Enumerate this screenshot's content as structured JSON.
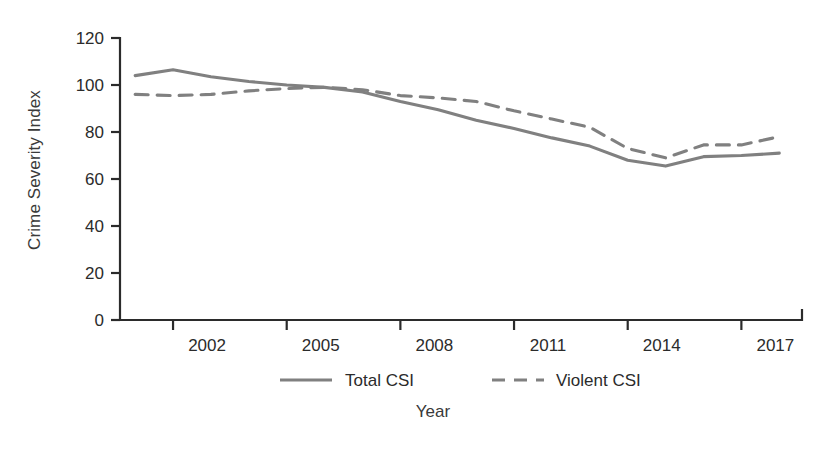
{
  "chart_data": {
    "type": "line",
    "title": "",
    "xlabel": "Year",
    "ylabel": "Crime Severity Index",
    "x": [
      2001,
      2002,
      2003,
      2004,
      2005,
      2006,
      2007,
      2008,
      2009,
      2010,
      2011,
      2012,
      2013,
      2014,
      2015,
      2016,
      2017,
      2018
    ],
    "xlim": [
      2000.6,
      2018.6
    ],
    "ylim": [
      0,
      120
    ],
    "yticks": [
      0,
      20,
      40,
      60,
      80,
      100,
      120
    ],
    "xticks": [
      2002,
      2005,
      2008,
      2011,
      2014,
      2017
    ],
    "xtick_labels": [
      "2002",
      "2005",
      "2008",
      "2011",
      "2014",
      "2017"
    ],
    "ytick_labels": [
      "0",
      "20",
      "40",
      "60",
      "80",
      "100",
      "120"
    ],
    "grid": false,
    "legend_position": "below-axes",
    "series": [
      {
        "name": "Total CSI",
        "style": "solid",
        "color": "#808080",
        "values": [
          104,
          106.5,
          103.5,
          101.5,
          100,
          99,
          97,
          93,
          89.5,
          85,
          81.5,
          77.5,
          74,
          68,
          65.5,
          69.5,
          70,
          71
        ]
      },
      {
        "name": "Violent CSI",
        "style": "dashed",
        "color": "#808080",
        "values": [
          96,
          95.5,
          96,
          97.5,
          98.5,
          99,
          98,
          95.5,
          94.5,
          93,
          89,
          85.5,
          82,
          73,
          69,
          74.5,
          74.5,
          78
        ]
      }
    ]
  },
  "legend": {
    "items": [
      {
        "label": "Total CSI",
        "style": "solid"
      },
      {
        "label": "Violent CSI",
        "style": "dashed"
      }
    ]
  },
  "axis_titles": {
    "x": "Year",
    "y": "Crime Severity Index"
  }
}
